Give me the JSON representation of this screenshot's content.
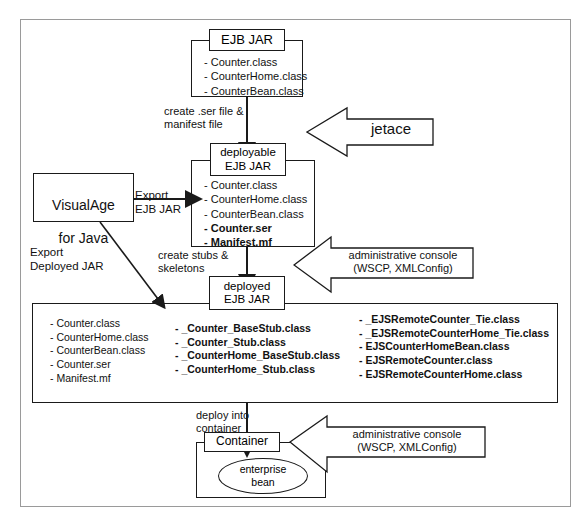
{
  "diagram": {
    "boxes": {
      "ejb_jar": {
        "tab_label": "EJB JAR",
        "items": [
          "- Counter.class",
          "- CounterHome.class",
          "- CounterBean.class"
        ]
      },
      "deployable_ejb_jar": {
        "tab_label_line1": "deployable",
        "tab_label_line2": "EJB JAR",
        "items_plain": [
          "- Counter.class",
          "- CounterHome.class",
          "- CounterBean.class"
        ],
        "items_bold": [
          "- Counter.ser",
          "- Manifest.mf"
        ]
      },
      "deployed_ejb_jar": {
        "tab_label_line1": "deployed",
        "tab_label_line2": "EJB JAR",
        "column1": [
          "- Counter.class",
          "- CounterHome.class",
          "- CounterBean.class",
          "- Counter.ser",
          "- Manifest.mf"
        ],
        "column2": [
          "- _Counter_BaseStub.class",
          "- _Counter_Stub.class",
          "- _CounterHome_BaseStub.class",
          "- _CounterHome_Stub.class"
        ],
        "column3": [
          "- _EJSRemoteCounter_Tie.class",
          "- _EJSRemoteCounterHome_Tie.class",
          "- EJSCounterHomeBean.class",
          "- EJSRemoteCounter.class",
          "- EJSRemoteCounterHome.class"
        ]
      },
      "visualage": {
        "line1": "VisualAge",
        "line2": "for Java"
      },
      "container": {
        "tab_label": "Container",
        "bean_line1": "enterprise",
        "bean_line2": "bean"
      }
    },
    "edge_labels": {
      "create_ser": "create .ser file &\nmanifest file",
      "export_ejb_jar": "Export\nEJB JAR",
      "export_deployed_jar": "Export\nDeployed JAR",
      "create_stubs": "create stubs &\nskeletons",
      "deploy_into_container": "deploy into\ncontainer"
    },
    "callouts": {
      "jetace": "jetace",
      "admin_console_1": "administrative console\n(WSCP, XMLConfig)",
      "admin_console_2": "administrative console\n(WSCP, XMLConfig)"
    },
    "colors": {
      "line": "#1a1a1a",
      "frame": "#9a9a9a",
      "text": "#111111",
      "background": "#ffffff"
    }
  }
}
